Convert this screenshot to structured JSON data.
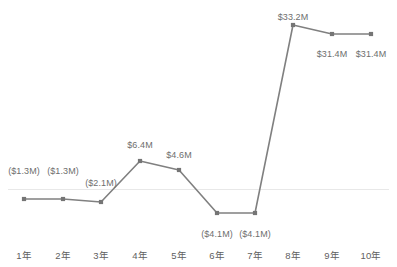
{
  "chart_data": {
    "type": "line",
    "title": "",
    "subtitle": "",
    "xlabel": "",
    "ylabel": "",
    "categories": [
      "1年",
      "2年",
      "3年",
      "4年",
      "5年",
      "6年",
      "7年",
      "8年",
      "9年",
      "10年"
    ],
    "values": [
      -1.3,
      -1.3,
      -2.1,
      6.4,
      4.6,
      -4.1,
      -4.1,
      33.2,
      31.4,
      31.4
    ],
    "data_labels": [
      "($1.3M)",
      "($1.3M)",
      "($2.1M)",
      "$6.4M",
      "$4.6M",
      "($4.1M)",
      "($4.1M)",
      "$33.2M",
      "$31.4M",
      "$31.4M"
    ],
    "units": "M",
    "currency": "$",
    "negatives_in_parentheses": true,
    "series": [
      {
        "name": "",
        "values": [
          -1.3,
          -1.3,
          -2.1,
          6.4,
          4.6,
          -4.1,
          -4.1,
          33.2,
          31.4,
          31.4
        ],
        "color": "#808080",
        "marker": "square",
        "show_labels": true
      }
    ],
    "ylim": [
      -6.0,
      36.0
    ],
    "grid": false,
    "zero_line": true,
    "zero_line_color": "#e8e8e8",
    "legend": "none",
    "axis_line": false,
    "tick_marks": false,
    "label_positions": [
      "above",
      "above",
      "above",
      "above",
      "above",
      "below",
      "below",
      "above",
      "below",
      "below"
    ]
  },
  "colors": {
    "line": "#808080",
    "marker": "#757575",
    "label_text": "#6e6e6e",
    "tick_text": "#5f5f5f",
    "zero_line": "#e8e8e8",
    "background": "#ffffff"
  },
  "geometry": {
    "points_px": [
      {
        "x": 24,
        "y": 199
      },
      {
        "x": 63,
        "y": 199
      },
      {
        "x": 101,
        "y": 202
      },
      {
        "x": 140,
        "y": 161
      },
      {
        "x": 179,
        "y": 170
      },
      {
        "x": 217,
        "y": 213
      },
      {
        "x": 255,
        "y": 213
      },
      {
        "x": 293,
        "y": 25
      },
      {
        "x": 332,
        "y": 34
      },
      {
        "x": 371,
        "y": 34
      }
    ],
    "zero_y_px": 189,
    "label_y_px": [
      166,
      166,
      178,
      140,
      150,
      229,
      229,
      12,
      49,
      49
    ],
    "tick_y_px": 250
  }
}
